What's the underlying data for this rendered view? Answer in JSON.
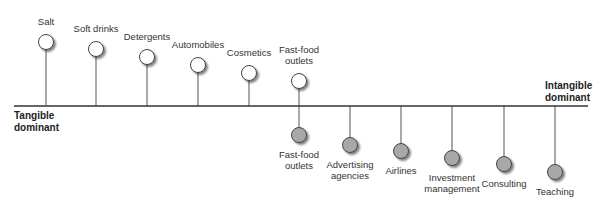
{
  "diagram": {
    "type": "tangible-intangible-continuum",
    "axis": {
      "left_label": "Tangible\ndominant",
      "right_label": "Intangible\ndominant",
      "y": 106,
      "x_start": 14,
      "x_end": 588
    },
    "colors": {
      "axis": "#333333",
      "stem": "#555555",
      "tangible_fill": "#ffffff",
      "intangible_fill": "#a8a8a8",
      "outline": "#444444",
      "shadow": "#999999"
    },
    "tangible_items": [
      {
        "label": "Salt",
        "x": 46,
        "cy": 42
      },
      {
        "label": "Soft drinks",
        "x": 96,
        "cy": 49
      },
      {
        "label": "Detergents",
        "x": 147,
        "cy": 57
      },
      {
        "label": "Automobiles",
        "x": 198,
        "cy": 65
      },
      {
        "label": "Cosmetics",
        "x": 249,
        "cy": 73
      },
      {
        "label": "Fast-food\noutlets",
        "x": 299,
        "cy": 81
      }
    ],
    "intangible_items": [
      {
        "label": "Fast-food\noutlets",
        "x": 299,
        "cy": 135
      },
      {
        "label": "Advertising\nagencies",
        "x": 350,
        "cy": 145
      },
      {
        "label": "Airlines",
        "x": 401,
        "cy": 151
      },
      {
        "label": "Investment\nmanagement",
        "x": 452,
        "cy": 158
      },
      {
        "label": "Consulting",
        "x": 504,
        "cy": 164
      },
      {
        "label": "Teaching",
        "x": 555,
        "cy": 172
      }
    ]
  }
}
